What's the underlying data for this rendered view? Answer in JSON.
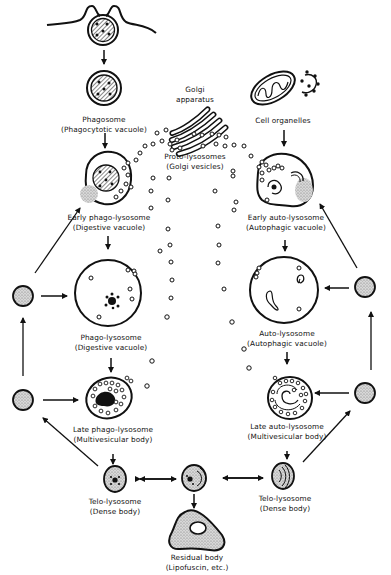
{
  "diagram": {
    "type": "lysosome-pathway-cycle",
    "labels": {
      "phagosome": {
        "title": "Phagosome",
        "subtitle": "(Phagocytotic vacuole)"
      },
      "golgi": {
        "title": "Golgi",
        "subtitle": "apparatus"
      },
      "cell_organelles": {
        "title": "Cell organelles"
      },
      "proto_lysosomes": {
        "title": "Proto-lysosomes",
        "subtitle": "(Golgi vesicles)"
      },
      "early_phago_lysosome": {
        "title": "Early phago-lysosome",
        "subtitle": "(Digestive vacuole)"
      },
      "early_auto_lysosome": {
        "title": "Early auto-lysosome",
        "subtitle": "(Autophagic vacuole)"
      },
      "phago_lysosome": {
        "title": "Phago-lysosome",
        "subtitle": "(Digestive vacuole)"
      },
      "auto_lysosome": {
        "title": "Auto-lysosome",
        "subtitle": "(Autophagic vacuole)"
      },
      "late_phago_lysosome": {
        "title": "Late phago-lysosome",
        "subtitle": "(Multivesicular body)"
      },
      "late_auto_lysosome": {
        "title": "Late auto-lysosome",
        "subtitle": "(Multivesicular body)"
      },
      "telo_lysosome_left": {
        "title": "Telo-lysosome",
        "subtitle": "(Dense body)"
      },
      "telo_lysosome_right": {
        "title": "Telo-lysosome",
        "subtitle": "(Dense body)"
      },
      "residual_body": {
        "title": "Residual body",
        "subtitle": "(Lipofuscin, etc.)"
      }
    },
    "colors": {
      "ink": "#111111",
      "background": "#ffffff",
      "stipple": "#bdbdbd"
    }
  }
}
